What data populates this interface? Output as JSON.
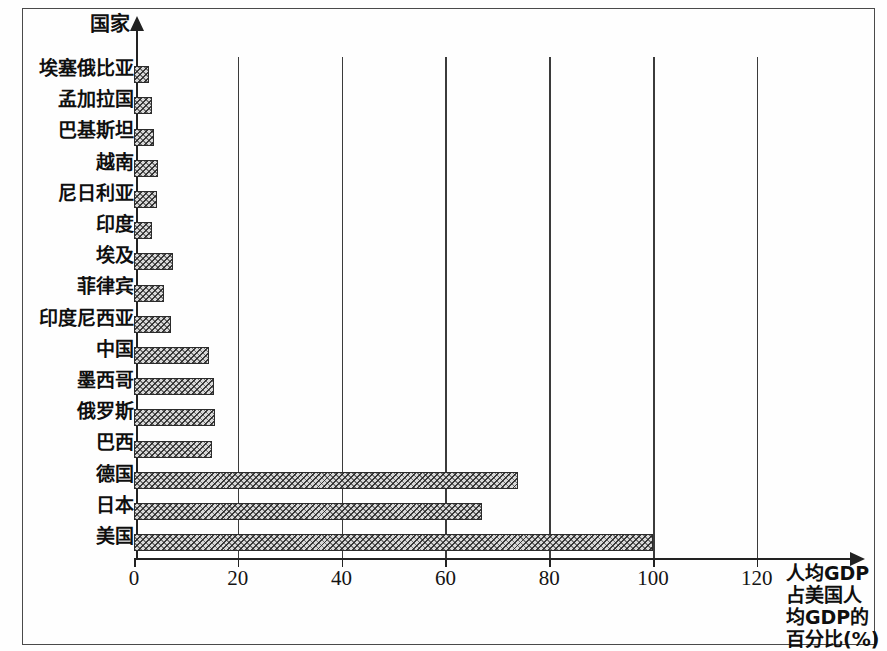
{
  "chart_data": {
    "type": "bar",
    "orientation": "horizontal",
    "title": "",
    "xlabel": "人均GDP占美国人均GDP的百分比(%)",
    "ylabel": "国家",
    "xlabel_lines": [
      "人均GDP",
      "占美国人",
      "均GDP的",
      "百分比(%)"
    ],
    "xlim": [
      0,
      128
    ],
    "xticks": [
      0,
      20,
      40,
      60,
      80,
      100,
      120
    ],
    "xtick_labels": [
      "0",
      "20",
      "40",
      "60",
      "80",
      "100",
      "120"
    ],
    "grid": "vertical",
    "legend": "none",
    "categories": [
      "埃塞俄比亚",
      "孟加拉国",
      "巴基斯坦",
      "越南",
      "尼日利亚",
      "印度",
      "埃及",
      "菲律宾",
      "印度尼西亚",
      "中国",
      "墨西哥",
      "俄罗斯",
      "巴西",
      "德国",
      "日本",
      "美国"
    ],
    "values": [
      2.8,
      3.5,
      3.9,
      4.6,
      4.4,
      3.5,
      7.5,
      5.8,
      7.1,
      14.4,
      15.4,
      15.6,
      15.1,
      74,
      67,
      100
    ],
    "bar_color": "#d8d8d8",
    "bar_edge_color": "#2b2b2b"
  },
  "axis": {
    "y_title": "国家",
    "x_title_lines": [
      "人均GDP",
      "占美国人",
      "均GDP的",
      "百分比(%)"
    ]
  }
}
